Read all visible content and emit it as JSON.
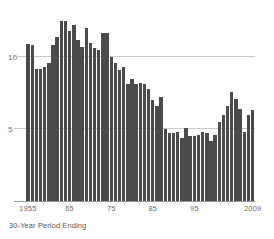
{
  "chart_data": {
    "type": "bar",
    "title": "",
    "subtitle": "",
    "xlabel": "30-Year Period Ending",
    "ylabel": "",
    "grid": true,
    "legend": false,
    "bar_color": "#4b4b4b",
    "grid_color": "#c9c9c9",
    "axis_color": "#9a9a9a",
    "tick_text_color": "#6e6e6e",
    "ylim": [
      0,
      13.4
    ],
    "y_ticks": [
      5,
      10
    ],
    "y_tick_labels": [
      "5",
      "10"
    ],
    "x_tick_labels": [
      "1955",
      "65",
      "75",
      "85",
      "95",
      "2009"
    ],
    "x_tick_values": [
      1955,
      1965,
      1975,
      1985,
      1995,
      2009
    ],
    "categories": [
      1955,
      1956,
      1957,
      1958,
      1959,
      1960,
      1961,
      1962,
      1963,
      1964,
      1965,
      1966,
      1967,
      1968,
      1969,
      1970,
      1971,
      1972,
      1973,
      1974,
      1975,
      1976,
      1977,
      1978,
      1979,
      1980,
      1981,
      1982,
      1983,
      1984,
      1985,
      1986,
      1987,
      1988,
      1989,
      1990,
      1991,
      1992,
      1993,
      1994,
      1995,
      1996,
      1997,
      1998,
      1999,
      2000,
      2001,
      2002,
      2003,
      2004,
      2005,
      2006,
      2007,
      2008,
      2009
    ],
    "values": [
      10.9,
      10.8,
      9.2,
      9.2,
      9.3,
      9.6,
      10.8,
      11.4,
      12.5,
      12.5,
      11.8,
      12.2,
      11.2,
      10.7,
      12.0,
      11.0,
      10.6,
      10.5,
      11.7,
      11.7,
      10.0,
      9.6,
      9.1,
      9.3,
      8.1,
      8.5,
      8.1,
      8.2,
      8.1,
      7.8,
      7.0,
      6.6,
      7.2,
      5.0,
      4.7,
      4.7,
      4.8,
      4.4,
      5.1,
      4.5,
      4.5,
      4.6,
      4.8,
      4.7,
      4.2,
      4.6,
      5.5,
      6.0,
      6.6,
      7.6,
      7.1,
      6.4,
      4.8,
      6.0,
      6.3
    ],
    "extra_values": [
      6.9,
      6.6,
      6.6,
      7.3,
      5.8,
      6.3
    ]
  },
  "axis": {
    "y_label_10": "10",
    "y_label_5": "5",
    "x_label_1": "1955",
    "x_label_2": "65",
    "x_label_3": "75",
    "x_label_4": "85",
    "x_label_5": "95",
    "x_label_6": "2009"
  },
  "caption": {
    "text": "30-Year Period Ending"
  }
}
